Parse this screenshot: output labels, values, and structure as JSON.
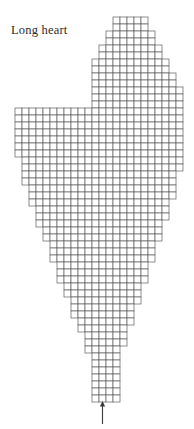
{
  "title": "Long heart",
  "chart_data": {
    "type": "grid-chart",
    "title": "Long heart",
    "cell_size": 7,
    "origin_x": 15,
    "origin_y": 17,
    "grid_columns": 24,
    "grid_rows": 55,
    "colors": {
      "cell_fill": "#ffffff",
      "cell_stroke": "#5e5e5e",
      "arrow": "#3a3a3a",
      "title_text": "#2b2b2b",
      "background": "#ffffff"
    },
    "rows": [
      {
        "row": 1,
        "start_col": 14,
        "end_col": 18
      },
      {
        "row": 2,
        "start_col": 14,
        "end_col": 18
      },
      {
        "row": 3,
        "start_col": 13,
        "end_col": 19
      },
      {
        "row": 4,
        "start_col": 13,
        "end_col": 19
      },
      {
        "row": 5,
        "start_col": 12,
        "end_col": 20
      },
      {
        "row": 6,
        "start_col": 12,
        "end_col": 20
      },
      {
        "row": 7,
        "start_col": 11,
        "end_col": 21
      },
      {
        "row": 8,
        "start_col": 11,
        "end_col": 21
      },
      {
        "row": 9,
        "start_col": 11,
        "end_col": 22
      },
      {
        "row": 10,
        "start_col": 11,
        "end_col": 22
      },
      {
        "row": 11,
        "start_col": 11,
        "end_col": 23
      },
      {
        "row": 12,
        "start_col": 11,
        "end_col": 23
      },
      {
        "row": 13,
        "start_col": 11,
        "end_col": 23
      },
      {
        "row": 14,
        "start_col": 0,
        "end_col": 23
      },
      {
        "row": 15,
        "start_col": 0,
        "end_col": 23
      },
      {
        "row": 16,
        "start_col": 0,
        "end_col": 23
      },
      {
        "row": 17,
        "start_col": 0,
        "end_col": 23
      },
      {
        "row": 18,
        "start_col": 0,
        "end_col": 23
      },
      {
        "row": 19,
        "start_col": 0,
        "end_col": 23
      },
      {
        "row": 20,
        "start_col": 0,
        "end_col": 23
      },
      {
        "row": 21,
        "start_col": 1,
        "end_col": 23
      },
      {
        "row": 22,
        "start_col": 1,
        "end_col": 23
      },
      {
        "row": 23,
        "start_col": 1,
        "end_col": 22
      },
      {
        "row": 24,
        "start_col": 1,
        "end_col": 22
      },
      {
        "row": 25,
        "start_col": 2,
        "end_col": 22
      },
      {
        "row": 26,
        "start_col": 2,
        "end_col": 22
      },
      {
        "row": 27,
        "start_col": 2,
        "end_col": 21
      },
      {
        "row": 28,
        "start_col": 3,
        "end_col": 21
      },
      {
        "row": 29,
        "start_col": 3,
        "end_col": 21
      },
      {
        "row": 30,
        "start_col": 3,
        "end_col": 20
      },
      {
        "row": 31,
        "start_col": 4,
        "end_col": 20
      },
      {
        "row": 32,
        "start_col": 4,
        "end_col": 20
      },
      {
        "row": 33,
        "start_col": 5,
        "end_col": 19
      },
      {
        "row": 34,
        "start_col": 5,
        "end_col": 19
      },
      {
        "row": 35,
        "start_col": 5,
        "end_col": 19
      },
      {
        "row": 36,
        "start_col": 6,
        "end_col": 18
      },
      {
        "row": 37,
        "start_col": 6,
        "end_col": 18
      },
      {
        "row": 38,
        "start_col": 6,
        "end_col": 18
      },
      {
        "row": 39,
        "start_col": 7,
        "end_col": 17
      },
      {
        "row": 40,
        "start_col": 7,
        "end_col": 17
      },
      {
        "row": 41,
        "start_col": 8,
        "end_col": 17
      },
      {
        "row": 42,
        "start_col": 8,
        "end_col": 16
      },
      {
        "row": 43,
        "start_col": 8,
        "end_col": 16
      },
      {
        "row": 44,
        "start_col": 9,
        "end_col": 16
      },
      {
        "row": 45,
        "start_col": 9,
        "end_col": 15
      },
      {
        "row": 46,
        "start_col": 10,
        "end_col": 15
      },
      {
        "row": 47,
        "start_col": 10,
        "end_col": 15
      },
      {
        "row": 48,
        "start_col": 10,
        "end_col": 14
      },
      {
        "row": 49,
        "start_col": 11,
        "end_col": 14
      },
      {
        "row": 50,
        "start_col": 11,
        "end_col": 14
      },
      {
        "row": 51,
        "start_col": 11,
        "end_col": 14
      },
      {
        "row": 52,
        "start_col": 11,
        "end_col": 14
      },
      {
        "row": 53,
        "start_col": 11,
        "end_col": 14
      },
      {
        "row": 54,
        "start_col": 11,
        "end_col": 14
      },
      {
        "row": 55,
        "start_col": 11,
        "end_col": 14
      }
    ],
    "annotations": [
      {
        "name": "start-arrow",
        "kind": "arrow",
        "direction": "up",
        "tip_col": 12.5,
        "tip_row": 55,
        "length_px": 22
      }
    ]
  }
}
